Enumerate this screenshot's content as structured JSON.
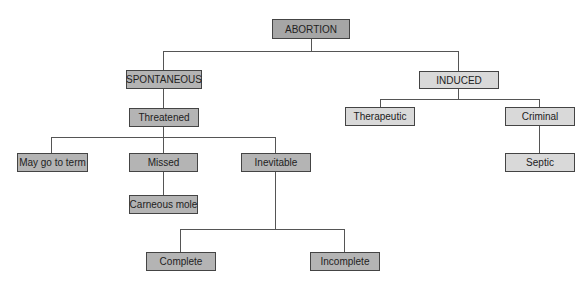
{
  "diagram": {
    "type": "tree",
    "colors": {
      "root": "#a6a6a6",
      "spontaneous_branch": "#b4b4b4",
      "induced_branch": "#d9d9d9",
      "line": "#555555"
    },
    "root": {
      "label": "ABORTION"
    },
    "spontaneous": {
      "label": "SPONTANEOUS",
      "threatened": {
        "label": "Threatened"
      },
      "may_go_to_term": {
        "label": "May go to term"
      },
      "missed": {
        "label": "Missed"
      },
      "carneous_mole": {
        "label": "Carneous mole"
      },
      "inevitable": {
        "label": "Inevitable"
      },
      "complete": {
        "label": "Complete"
      },
      "incomplete": {
        "label": "Incomplete"
      }
    },
    "induced": {
      "label": "INDUCED",
      "therapeutic": {
        "label": "Therapeutic"
      },
      "criminal": {
        "label": "Criminal"
      },
      "septic": {
        "label": "Septic"
      }
    }
  }
}
